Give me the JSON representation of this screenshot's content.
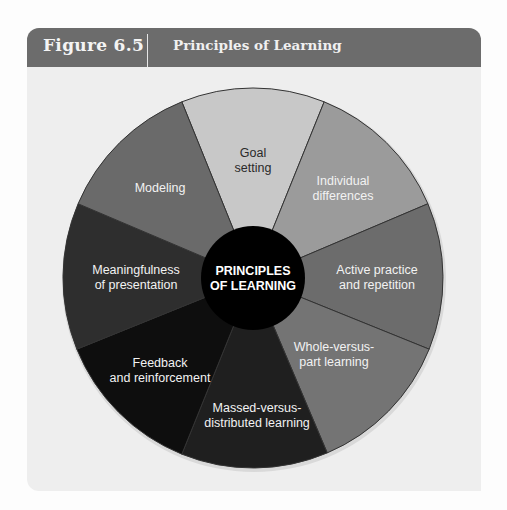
{
  "header": {
    "figure_number": "Figure 6.5",
    "title": "Principles of Learning"
  },
  "diagram": {
    "center": {
      "lines": [
        "PRINCIPLES",
        "OF LEARNING"
      ],
      "color": "#000000"
    },
    "wedges": [
      {
        "id": "goal-setting",
        "lines": [
          "Goal",
          "setting"
        ],
        "fill": "#c8c8c8",
        "text_color": "#2a2a2a"
      },
      {
        "id": "individual-differences",
        "lines": [
          "Individual",
          "differences"
        ],
        "fill": "#9b9b9b",
        "text_color": "#f2f2f2"
      },
      {
        "id": "active-practice",
        "lines": [
          "Active practice",
          "and repetition"
        ],
        "fill": "#6c6c6c",
        "text_color": "#f2f2f2"
      },
      {
        "id": "whole-versus-part",
        "lines": [
          "Whole-versus-",
          "part learning"
        ],
        "fill": "#747474",
        "text_color": "#f2f2f2"
      },
      {
        "id": "massed-versus-distributed",
        "lines": [
          "Massed-versus-",
          "distributed learning"
        ],
        "fill": "#1f1f1f",
        "text_color": "#f2f2f2"
      },
      {
        "id": "feedback-reinforcement",
        "lines": [
          "Feedback",
          "and reinforcement"
        ],
        "fill": "#0e0e0e",
        "text_color": "#f2f2f2"
      },
      {
        "id": "meaningfulness",
        "lines": [
          "Meaningfulness",
          "of presentation"
        ],
        "fill": "#2e2e2e",
        "text_color": "#f2f2f2"
      },
      {
        "id": "modeling",
        "lines": [
          "Modeling"
        ],
        "fill": "#6a6a6a",
        "text_color": "#f2f2f2"
      }
    ],
    "spoke_color": "#333333"
  }
}
